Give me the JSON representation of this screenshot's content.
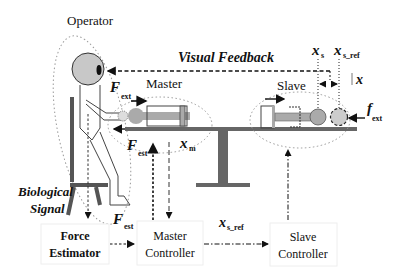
{
  "diagram": {
    "labels": {
      "operator": "Operator",
      "master": "Master",
      "slave": "Slave",
      "visual_feedback": "Visual Feedback",
      "biological_signal_line1": "Biological",
      "biological_signal_line2": "Signal"
    },
    "symbols": {
      "F_ext_main": "F",
      "F_ext_sub": "ext",
      "F_est_main": "F",
      "F_est_sub": "est",
      "x_m_main": "x",
      "x_m_sub": "m",
      "x_s_main": "x",
      "x_s_sub": "s",
      "x_sref_main": "x",
      "x_sref_sub": "s_ref",
      "delta_x": "x",
      "f_ext_main": "f",
      "f_ext_sub": "ext",
      "F_est2_main": "F",
      "F_est2_sub": "est",
      "x_sref2_main": "x",
      "x_sref2_sub": "s_ref"
    },
    "blocks": [
      {
        "id": "force-estimator",
        "line1": "Force",
        "line2": "Estimator"
      },
      {
        "id": "master-controller",
        "line1": "Master",
        "line2": "Controller"
      },
      {
        "id": "slave-controller",
        "line1": "Slave",
        "line2": "Controller"
      }
    ],
    "colors": {
      "head_fill": "#c8c8c8",
      "link_fill": "#999999",
      "base_fill": "#666666",
      "line": "#222222",
      "dotted": "#888888"
    }
  }
}
